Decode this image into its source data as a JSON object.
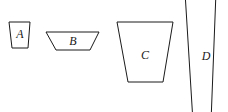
{
  "figure": {
    "canvas": {
      "width": 228,
      "height": 112,
      "background": "#ffffff"
    },
    "style": {
      "stroke_color": "#1a1a1a",
      "fill_color": "#ffffff",
      "stroke_width": 1,
      "label_color": "#1a1a1a",
      "label_font_size": 12,
      "label_style": "italic"
    },
    "shapes": [
      {
        "id": "A",
        "label": "A",
        "type": "trapezoid",
        "points": "9,22 30,22 28,48 12,48",
        "label_x": 20,
        "label_y": 35,
        "description": "small trapezoid, wider top, narrower bottom"
      },
      {
        "id": "B",
        "label": "B",
        "type": "trapezoid",
        "points": "46,32 99,32 90,50 56,50",
        "label_x": 73,
        "label_y": 42,
        "description": "wide short trapezoid, wider top, narrower bottom"
      },
      {
        "id": "C",
        "label": "C",
        "type": "trapezoid",
        "points": "117,22 173,22 163,82 128,82",
        "label_x": 145,
        "label_y": 56,
        "description": "large trapezoid, wider top, narrower bottom"
      },
      {
        "id": "D",
        "label": "D",
        "type": "trapezoid",
        "points": "185,-8 216,-8 211,122 193,122",
        "label_x": 206,
        "label_y": 57,
        "description": "tall narrow trapezoid clipped at top and bottom of canvas"
      }
    ]
  }
}
